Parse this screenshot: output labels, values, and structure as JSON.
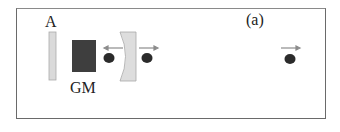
{
  "figure": {
    "panel_label": "(a)",
    "components": [
      {
        "id": "A",
        "label": "A",
        "type": "plate",
        "color": "#d8d8d8"
      },
      {
        "id": "GM",
        "label": "GM",
        "type": "block",
        "color": "#3c3c3c"
      },
      {
        "id": "mirror",
        "label": "",
        "type": "concave-mirror",
        "color": "#dcdcdc"
      }
    ],
    "particles": [
      {
        "id": "ball-1",
        "direction": "left",
        "color": "#2a2a2a"
      },
      {
        "id": "ball-2",
        "direction": "right",
        "color": "#2a2a2a"
      },
      {
        "id": "ball-3",
        "direction": "right",
        "color": "#2a2a2a"
      }
    ],
    "arrow_color": "#8a8a8a"
  }
}
